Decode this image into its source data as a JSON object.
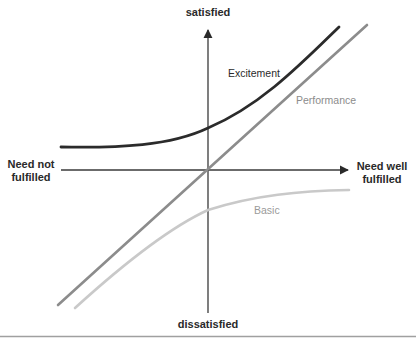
{
  "diagram": {
    "type": "kano-model",
    "axes": {
      "y_top": "satisfied",
      "y_bottom": "dissatisfied",
      "x_left_line1": "Need not",
      "x_left_line2": "fulfilled",
      "x_right_line1": "Need well",
      "x_right_line2": "fulfilled"
    },
    "curves": [
      {
        "name": "Excitement",
        "color": "#2b2b2b"
      },
      {
        "name": "Performance",
        "color": "#8c8c8c"
      },
      {
        "name": "Basic",
        "color": "#c9c9c9"
      }
    ],
    "colors": {
      "axis": "#3a3a3a",
      "bottom_rule": "#a0a0a0"
    }
  }
}
